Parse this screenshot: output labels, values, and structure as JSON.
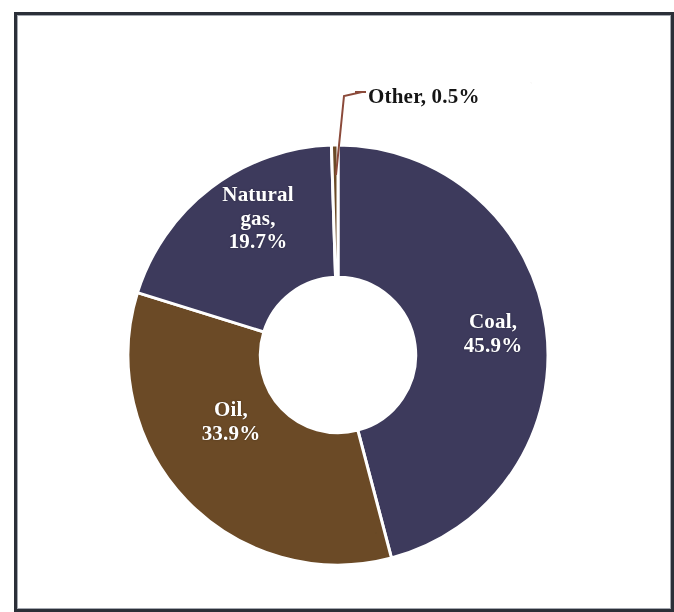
{
  "chart_data": {
    "type": "pie",
    "variant": "donut",
    "title": "",
    "subtitle": "",
    "xlabel": "",
    "ylabel": "",
    "legend_position": "none",
    "grid": false,
    "units": "percent",
    "start_angle_deg": 0,
    "direction": "clockwise",
    "inner_radius_ratio": 0.37,
    "categories": [
      "Coal",
      "Oil",
      "Natural gas",
      "Other"
    ],
    "values": [
      45.9,
      33.9,
      19.7,
      0.5
    ],
    "slices": [
      {
        "name": "Coal",
        "label": "Coal,\n45.9%",
        "value": 45.9,
        "value_text": "45.9%",
        "color": "#3d3a5c",
        "label_color": "#ffffff",
        "label_placement": "inside"
      },
      {
        "name": "Oil",
        "label": "Oil,\n33.9%",
        "value": 33.9,
        "value_text": "33.9%",
        "color": "#6b4a26",
        "label_color": "#ffffff",
        "label_placement": "inside"
      },
      {
        "name": "Natural gas",
        "label": "Natural\ngas,\n19.7%",
        "value": 19.7,
        "value_text": "19.7%",
        "color": "#3d3a5c",
        "label_color": "#ffffff",
        "label_placement": "inside"
      },
      {
        "name": "Other",
        "label": "Other, 0.5%",
        "value": 0.5,
        "value_text": "0.5%",
        "color": "#6b4a26",
        "label_color": "#151515",
        "label_placement": "outside-callout",
        "leader_color": "#8b4a3a"
      }
    ],
    "separator_color": "#ffffff",
    "background_color": "#ffffff"
  },
  "frame": {
    "border_color": "#2b2f38"
  }
}
